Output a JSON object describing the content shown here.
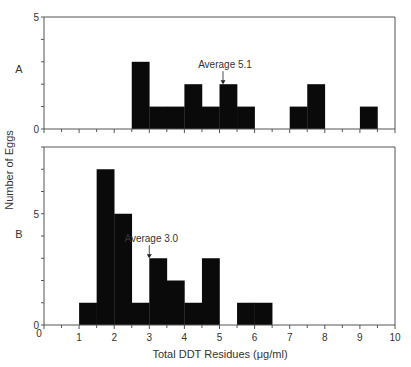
{
  "chart_data": {
    "type": "bar",
    "ylabel": "Number of Eggs",
    "xlabel": "Total DDT Residues (μg/ml)",
    "x_ticks": [
      0,
      1,
      2,
      3,
      4,
      5,
      6,
      7,
      8,
      9,
      10
    ],
    "xlim": [
      0,
      10
    ],
    "bin_width": 0.5,
    "panels": [
      {
        "label": "A",
        "ylim": [
          0,
          5
        ],
        "y_tick_labels": [
          0,
          5
        ],
        "y_minor_step": 1,
        "annotation": {
          "text": "Average 5.1",
          "x": 5.1
        },
        "bins": [
          {
            "start": 2.5,
            "count": 3
          },
          {
            "start": 3.0,
            "count": 1
          },
          {
            "start": 3.5,
            "count": 1
          },
          {
            "start": 4.0,
            "count": 2
          },
          {
            "start": 4.5,
            "count": 1
          },
          {
            "start": 5.0,
            "count": 2
          },
          {
            "start": 5.5,
            "count": 1
          },
          {
            "start": 7.0,
            "count": 1
          },
          {
            "start": 7.5,
            "count": 2
          },
          {
            "start": 9.0,
            "count": 1
          }
        ]
      },
      {
        "label": "B",
        "ylim": [
          0,
          8
        ],
        "y_tick_labels": [
          0,
          5
        ],
        "y_minor_step": 1,
        "annotation": {
          "text": "Average 3.0",
          "x": 3.0
        },
        "bins": [
          {
            "start": 1.0,
            "count": 1
          },
          {
            "start": 1.5,
            "count": 7
          },
          {
            "start": 2.0,
            "count": 5
          },
          {
            "start": 2.5,
            "count": 1
          },
          {
            "start": 3.0,
            "count": 3
          },
          {
            "start": 3.5,
            "count": 2
          },
          {
            "start": 4.0,
            "count": 1
          },
          {
            "start": 4.5,
            "count": 3
          },
          {
            "start": 5.5,
            "count": 1
          },
          {
            "start": 6.0,
            "count": 1
          }
        ]
      }
    ]
  },
  "colors": {
    "bar": "#0a0a0a",
    "axis": "#555555",
    "text": "#333333"
  }
}
